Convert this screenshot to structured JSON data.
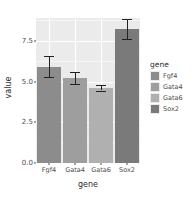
{
  "chart_data": {
    "type": "bar",
    "title": "",
    "xlabel": "gene",
    "ylabel": "value",
    "categories": [
      "Fgf4",
      "Gata4",
      "Gata6",
      "Sox2"
    ],
    "values": [
      5.9,
      5.2,
      4.6,
      8.2
    ],
    "errors_low": [
      5.25,
      4.85,
      4.45,
      7.6
    ],
    "errors_high": [
      6.55,
      5.6,
      4.8,
      8.85
    ],
    "ylim": [
      0.0,
      8.9
    ],
    "yticks": [
      0.0,
      2.5,
      5.0,
      7.5
    ],
    "ytick_labels": [
      "0.0",
      "2.5",
      "5.0",
      "7.5"
    ],
    "grid": true,
    "legend_position": "right",
    "legend_title": "gene",
    "series": [
      {
        "name": "Fgf4",
        "value": 5.9,
        "color": "#8c8c8c"
      },
      {
        "name": "Gata4",
        "value": 5.2,
        "color": "#9e9e9e"
      },
      {
        "name": "Gata6",
        "value": 4.6,
        "color": "#b0b0b0"
      },
      {
        "name": "Sox2",
        "value": 8.2,
        "color": "#7a7a7a"
      }
    ],
    "panel_background": "#ebebeb",
    "gridline_color": "#ffffff",
    "errorbar_color": "#222222"
  },
  "axis": {
    "y_title": "value",
    "x_title": "gene"
  },
  "legend": {
    "title": "gene",
    "items": [
      {
        "label": "Fgf4",
        "color": "#8c8c8c"
      },
      {
        "label": "Gata4",
        "color": "#9e9e9e"
      },
      {
        "label": "Gata6",
        "color": "#b0b0b0"
      },
      {
        "label": "Sox2",
        "color": "#7a7a7a"
      }
    ]
  }
}
